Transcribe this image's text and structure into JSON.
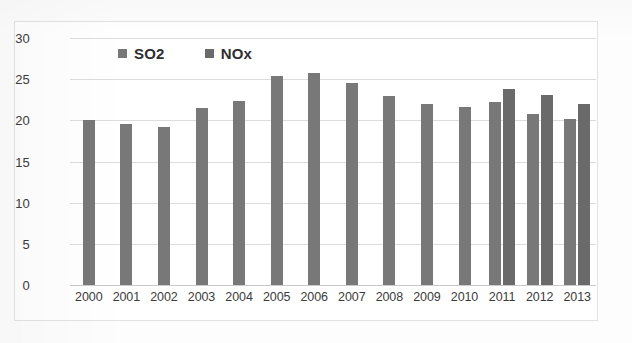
{
  "chart_data": {
    "type": "bar",
    "title": "",
    "subtitle": "",
    "xlabel": "",
    "ylabel": "",
    "ylim": [
      0,
      30
    ],
    "yticks": [
      0,
      5,
      10,
      15,
      20,
      25,
      30
    ],
    "grid": true,
    "legend_position": "top-center",
    "categories": [
      "2000",
      "2001",
      "2002",
      "2003",
      "2004",
      "2005",
      "2006",
      "2007",
      "2008",
      "2009",
      "2010",
      "2011",
      "2012",
      "2013"
    ],
    "series": [
      {
        "name": "SO2",
        "color": "#787878",
        "values": [
          20.0,
          19.5,
          19.2,
          21.5,
          22.4,
          25.4,
          25.8,
          24.5,
          23.0,
          22.0,
          21.6,
          22.2,
          20.8,
          20.2
        ]
      },
      {
        "name": "NOx",
        "color": "#6a6a6a",
        "values": [
          null,
          null,
          null,
          null,
          null,
          null,
          null,
          null,
          null,
          null,
          null,
          23.8,
          23.1,
          22.0
        ]
      }
    ]
  },
  "legend": {
    "items": [
      {
        "label": "SO2",
        "color": "#787878"
      },
      {
        "label": "NOx",
        "color": "#6a6a6a"
      }
    ]
  },
  "axes": {
    "y_tick_labels": [
      "30",
      "25",
      "20",
      "15",
      "10",
      "5",
      "0"
    ],
    "x_tick_labels": [
      "2000",
      "2001",
      "2002",
      "2003",
      "2004",
      "2005",
      "2006",
      "2007",
      "2008",
      "2009",
      "2010",
      "2011",
      "2012",
      "2013"
    ]
  }
}
